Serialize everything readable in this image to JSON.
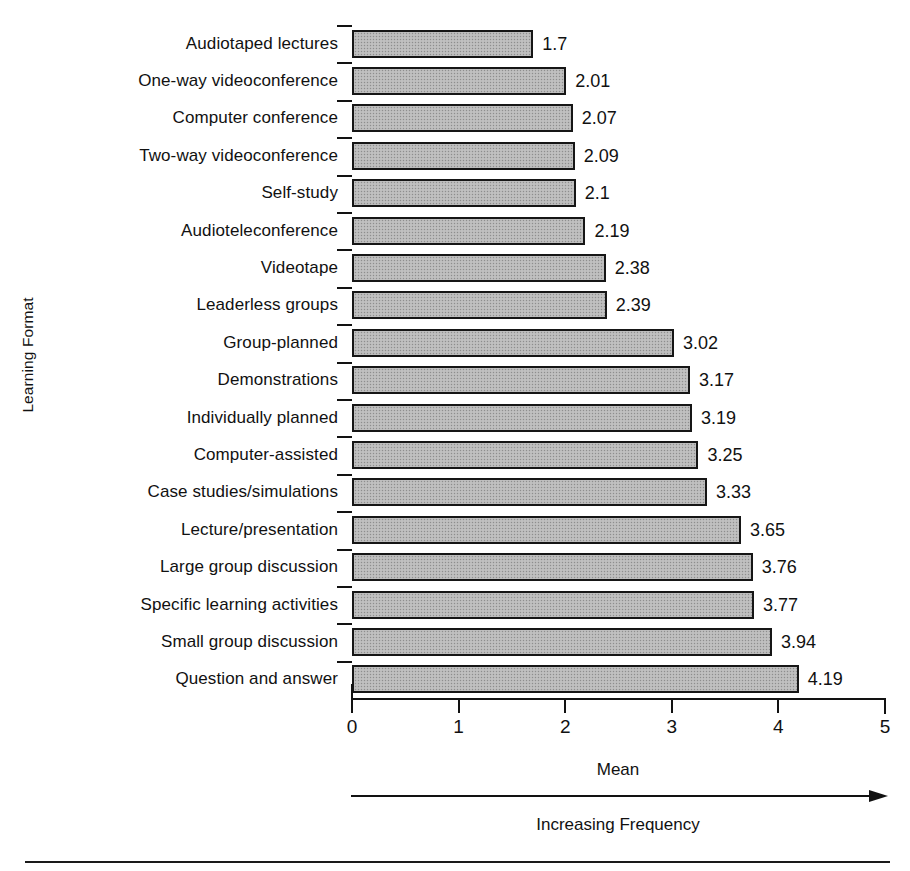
{
  "chart_data": {
    "type": "bar",
    "orientation": "horizontal",
    "title": "",
    "xlabel": "Mean",
    "ylabel": "Learning Format",
    "xlim": [
      0,
      5
    ],
    "xticks": [
      "0",
      "1",
      "2",
      "3",
      "4",
      "5"
    ],
    "grid": false,
    "legend": false,
    "annotation_arrow_label": "Increasing Frequency",
    "bar_fill_color": "#b9b9b9",
    "bar_border_color": "#161616",
    "categories": [
      "Audiotaped lectures",
      "One-way videoconference",
      "Computer conference",
      "Two-way videoconference",
      "Self-study",
      "Audioteleconference",
      "Videotape",
      "Leaderless groups",
      "Group-planned",
      "Demonstrations",
      "Individually planned",
      "Computer-assisted",
      "Case studies/simulations",
      "Lecture/presentation",
      "Large group discussion",
      "Specific learning activities",
      "Small group discussion",
      "Question and answer"
    ],
    "values": [
      1.7,
      2.01,
      2.07,
      2.09,
      2.1,
      2.19,
      2.38,
      2.39,
      3.02,
      3.17,
      3.19,
      3.25,
      3.33,
      3.65,
      3.76,
      3.77,
      3.94,
      4.19
    ],
    "value_labels": [
      "1.7",
      "2.01",
      "2.07",
      "2.09",
      "2.1",
      "2.19",
      "2.38",
      "2.39",
      "3.02",
      "3.17",
      "3.19",
      "3.25",
      "3.33",
      "3.65",
      "3.76",
      "3.77",
      "3.94",
      "4.19"
    ]
  }
}
